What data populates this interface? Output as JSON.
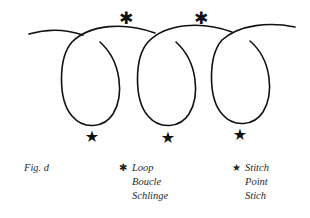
{
  "figure": {
    "label": "Fig. d",
    "markers": {
      "loop_symbol": "✱",
      "stitch_symbol": "★"
    },
    "legend": [
      {
        "symbol": "✱",
        "symbol_name": "asterisk-icon",
        "lines": [
          "Loop",
          "Boucle",
          "Schlinge"
        ]
      },
      {
        "symbol": "★",
        "symbol_name": "star-icon",
        "lines": [
          "Stitch",
          "Point",
          "Stich"
        ]
      }
    ],
    "colors": {
      "line": "#111111",
      "text": "#2a2a2a",
      "background": "#ffffff"
    }
  }
}
